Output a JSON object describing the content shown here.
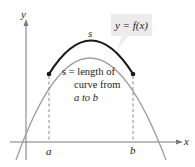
{
  "axes": {
    "x_label": "x",
    "y_label": "y"
  },
  "points": {
    "a_label": "a",
    "b_label": "b"
  },
  "curve": {
    "arc_label": "s",
    "function_label": "y = f(x)"
  },
  "annotation": {
    "line1": "s = length of",
    "line2": "curve from",
    "line3": "a to b"
  },
  "colors": {
    "arc": "#1a1a1a",
    "curve": "#a0a0a0",
    "axis": "#7a7a7a",
    "label_box": "#ececec"
  }
}
